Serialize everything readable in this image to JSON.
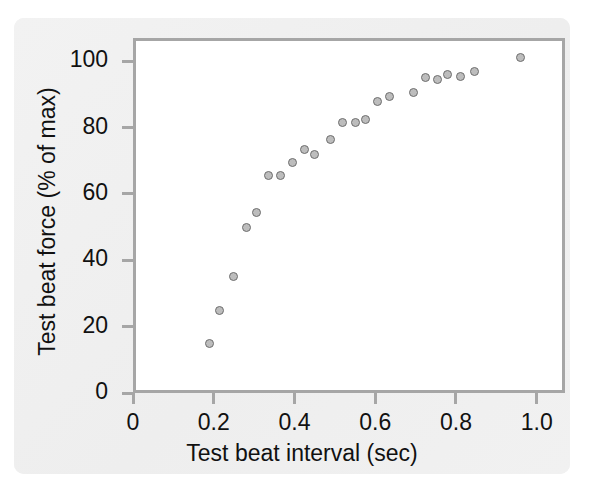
{
  "figure": {
    "width": 604,
    "height": 491,
    "background_color": "#f0f0f0",
    "plot_background_color": "#ffffff",
    "frame_color": "#a6a6a6",
    "marker_fill_color": "#bdbdbd",
    "marker_edge_color": "#6e6e6e",
    "text_color": "#111111"
  },
  "chart_data": {
    "type": "scatter",
    "title": "",
    "xlabel": "Test beat interval (sec)",
    "ylabel": "Test beat force (% of max)",
    "xlim": [
      0.0,
      1.07
    ],
    "ylim": [
      0,
      107
    ],
    "xticks": [
      0,
      0.2,
      0.4,
      0.6,
      0.8,
      1.0
    ],
    "xticklabels": [
      "0",
      "0.2",
      "0.4",
      "0.6",
      "0.8",
      "1.0"
    ],
    "yticks": [
      0,
      20,
      40,
      60,
      80,
      100
    ],
    "yticklabels": [
      "0",
      "20",
      "40",
      "60",
      "80",
      "100"
    ],
    "grid": false,
    "legend": null,
    "legend_position": "none",
    "series": [
      {
        "name": "Test beat force vs interval",
        "marker": "circle",
        "points": [
          {
            "x": 0.19,
            "y": 15
          },
          {
            "x": 0.215,
            "y": 25
          },
          {
            "x": 0.25,
            "y": 35
          },
          {
            "x": 0.28,
            "y": 50
          },
          {
            "x": 0.305,
            "y": 54.5
          },
          {
            "x": 0.335,
            "y": 65.5
          },
          {
            "x": 0.365,
            "y": 65.5
          },
          {
            "x": 0.395,
            "y": 69.5
          },
          {
            "x": 0.425,
            "y": 73.5
          },
          {
            "x": 0.45,
            "y": 72
          },
          {
            "x": 0.49,
            "y": 76.5
          },
          {
            "x": 0.52,
            "y": 81.5
          },
          {
            "x": 0.55,
            "y": 81.5
          },
          {
            "x": 0.575,
            "y": 82.5
          },
          {
            "x": 0.605,
            "y": 88
          },
          {
            "x": 0.635,
            "y": 89.5
          },
          {
            "x": 0.695,
            "y": 90.5
          },
          {
            "x": 0.725,
            "y": 95
          },
          {
            "x": 0.755,
            "y": 94.5
          },
          {
            "x": 0.78,
            "y": 96
          },
          {
            "x": 0.81,
            "y": 95.5
          },
          {
            "x": 0.845,
            "y": 97
          },
          {
            "x": 0.96,
            "y": 101
          }
        ]
      }
    ]
  }
}
